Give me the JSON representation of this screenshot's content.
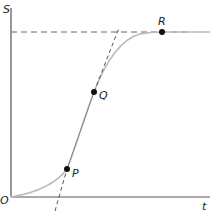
{
  "diagram": {
    "type": "sigmoid-growth-curve",
    "axes": {
      "y_label": "S",
      "x_label": "t",
      "origin_label": "O"
    },
    "points": [
      {
        "id": "P",
        "label": "P"
      },
      {
        "id": "Q",
        "label": "Q"
      },
      {
        "id": "R",
        "label": "R"
      }
    ],
    "elements": {
      "asymptote": "horizontal dashed line at saturation level through R",
      "tangent": "straight line through P and Q (dashed extensions beyond segment)",
      "curve": "S-shaped (logistic) curve from O rising to plateau at R"
    },
    "colors": {
      "axis": "#555555",
      "curve": "#bbbbbb",
      "points": "#111111",
      "dashed": "#666666"
    }
  }
}
